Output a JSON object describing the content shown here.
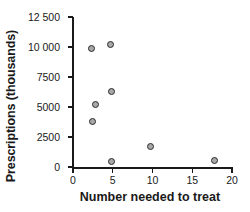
{
  "chart_data": {
    "type": "scatter",
    "title": "",
    "xlabel": "Number needed to treat",
    "ylabel": "Prescriptions (thousands)",
    "xlim": [
      0,
      20
    ],
    "ylim": [
      0,
      12500
    ],
    "grid": false,
    "legend": "none",
    "xticks": [
      "0",
      "5",
      "10",
      "15",
      "20"
    ],
    "xtick_values": [
      0,
      5,
      10,
      15,
      20
    ],
    "yticks": [
      "0",
      "2500",
      "5000",
      "7500",
      "10 000",
      "12 500"
    ],
    "ytick_values": [
      0,
      2500,
      5000,
      7500,
      10000,
      12500
    ],
    "series": [
      {
        "name": "drugs",
        "marker": "circle",
        "marker_fill": "#a8a8a8",
        "marker_edge": "#2b2b2b",
        "points": [
          {
            "x": 2.3,
            "y": 9900
          },
          {
            "x": 4.7,
            "y": 10200
          },
          {
            "x": 4.8,
            "y": 6300
          },
          {
            "x": 2.8,
            "y": 5200
          },
          {
            "x": 2.4,
            "y": 3800
          },
          {
            "x": 4.8,
            "y": 420
          },
          {
            "x": 9.7,
            "y": 1750
          },
          {
            "x": 17.8,
            "y": 580
          }
        ]
      }
    ]
  }
}
